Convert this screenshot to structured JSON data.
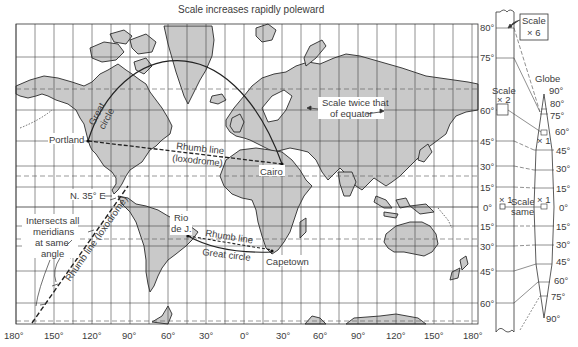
{
  "title": "Scale increases rapidly poleward",
  "longitude_ticks": [
    "180°",
    "150°",
    "120°",
    "90°",
    "60°",
    "30°",
    "0°",
    "30°",
    "60°",
    "90°",
    "120°",
    "150°",
    "180°"
  ],
  "latitude_ticks": [
    {
      "label": "80°",
      "y": 27
    },
    {
      "label": "75°",
      "y": 57
    },
    {
      "label": "60°",
      "y": 110
    },
    {
      "label": "45°",
      "y": 141
    },
    {
      "label": "30°",
      "y": 166
    },
    {
      "label": "15°",
      "y": 187
    },
    {
      "label": "0°",
      "y": 207
    },
    {
      "label": "15°",
      "y": 226
    },
    {
      "label": "30°",
      "y": 246
    },
    {
      "label": "45°",
      "y": 271
    },
    {
      "label": "60°",
      "y": 303
    }
  ],
  "places": {
    "portland": "Portland",
    "cairo": "Cairo",
    "rio_line1": "Rio",
    "rio_line2": "de J.",
    "capetown": "Capetown"
  },
  "annotations": {
    "great_circle_1": "Great",
    "great_circle_2": "circle",
    "rhumb_line_1": "Rhumb line",
    "loxodrome_1": "(loxodrome)",
    "scale_twice_1": "Scale twice that",
    "scale_twice_2": "of equator",
    "bearing": "N. 35° E",
    "intersects_1": "Intersects all",
    "intersects_2": "meridians",
    "intersects_3": "at same",
    "intersects_4": "angle",
    "rhumb_loxodrome_diag": "Rhumb line (loxodrome)",
    "rhumb_line_2": "Rhumb line",
    "great_circle_south": "Great circle"
  },
  "scale_strip": {
    "scale_x6_1": "Scale",
    "scale_x6_2": "× 6",
    "scale_x2_1": "Scale",
    "scale_x2_2": "× 2",
    "x1_left": "× 1",
    "scale_same_1": "Scale",
    "scale_same_2": "same",
    "x1_right": "× 1"
  },
  "globe": {
    "title": "Globe",
    "ticks": [
      "90°",
      "80°",
      "75°",
      "60°",
      "45°",
      "30°",
      "15°",
      "0°",
      "15°",
      "30°",
      "45°",
      "60°",
      "75°",
      "90°"
    ],
    "x1_label": "× 1"
  }
}
